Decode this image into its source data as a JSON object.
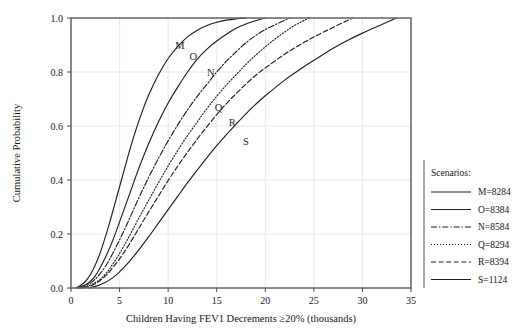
{
  "chart_data": {
    "type": "line",
    "title": "",
    "xlabel": "Children Having FEV1 Decrements ≥20% (thousands)",
    "ylabel": "Cumulative Probability",
    "xlim": [
      0,
      35
    ],
    "ylim": [
      0.0,
      1.0
    ],
    "xticks": [
      "0",
      "5",
      "10",
      "15",
      "20",
      "25",
      "30",
      "35"
    ],
    "xtick_values": [
      0,
      5,
      10,
      15,
      20,
      25,
      30,
      35
    ],
    "yticks": [
      "0.0",
      "0.2",
      "0.4",
      "0.6",
      "0.8",
      "1.0"
    ],
    "ytick_values": [
      0.0,
      0.2,
      0.4,
      0.6,
      0.8,
      1.0
    ],
    "grid": true,
    "legend_position": "right-outside",
    "legend_title": "Scenarios:",
    "series": [
      {
        "name": "M=8284",
        "tag": "M",
        "dash": "none",
        "style_name": "solid-thin",
        "x": [
          0.5,
          1.0,
          1.5,
          2.0,
          2.5,
          3.0,
          3.5,
          4.0,
          4.5,
          5.0,
          5.5,
          6.0,
          6.5,
          7.0,
          7.5,
          8.0,
          9.0,
          10.0,
          11.0,
          12.0,
          13.0,
          14.0,
          15.0,
          16.0,
          17.0,
          18.0
        ],
        "y": [
          0.0,
          0.01,
          0.025,
          0.05,
          0.085,
          0.13,
          0.185,
          0.245,
          0.31,
          0.375,
          0.44,
          0.505,
          0.565,
          0.62,
          0.67,
          0.715,
          0.79,
          0.85,
          0.895,
          0.93,
          0.955,
          0.972,
          0.984,
          0.992,
          0.997,
          1.0
        ]
      },
      {
        "name": "O=8384",
        "tag": "O",
        "dash": "none",
        "style_name": "solid",
        "x": [
          0.7,
          1.5,
          2.0,
          2.5,
          3.0,
          3.5,
          4.0,
          4.5,
          5.0,
          5.5,
          6.0,
          7.0,
          8.0,
          9.0,
          10.0,
          11.0,
          12.0,
          13.0,
          14.0,
          15.0,
          16.0,
          17.0,
          18.0,
          19.0,
          20.0
        ],
        "y": [
          0.0,
          0.012,
          0.025,
          0.045,
          0.075,
          0.11,
          0.15,
          0.195,
          0.245,
          0.295,
          0.345,
          0.445,
          0.535,
          0.615,
          0.685,
          0.745,
          0.8,
          0.848,
          0.885,
          0.915,
          0.94,
          0.962,
          0.978,
          0.99,
          1.0
        ]
      },
      {
        "name": "N=8584",
        "tag": "N",
        "dash": "dash-dot",
        "style_name": "dash-dot",
        "x": [
          0.9,
          1.5,
          2.0,
          2.5,
          3.0,
          3.5,
          4.0,
          5.0,
          6.0,
          7.0,
          8.0,
          9.0,
          10.0,
          11.0,
          12.0,
          13.0,
          14.0,
          15.0,
          16.0,
          17.0,
          18.0,
          19.0,
          20.0,
          21.0,
          22.5
        ],
        "y": [
          0.0,
          0.008,
          0.018,
          0.033,
          0.053,
          0.078,
          0.108,
          0.178,
          0.255,
          0.335,
          0.41,
          0.48,
          0.545,
          0.605,
          0.66,
          0.71,
          0.755,
          0.8,
          0.84,
          0.875,
          0.908,
          0.935,
          0.957,
          0.975,
          1.0
        ]
      },
      {
        "name": "Q=8294",
        "tag": "Q",
        "dash": "dotted",
        "style_name": "fine-dotted",
        "x": [
          1.0,
          1.8,
          2.5,
          3.0,
          3.5,
          4.0,
          5.0,
          6.0,
          7.0,
          8.0,
          9.0,
          10.0,
          11.0,
          12.0,
          13.0,
          14.0,
          15.0,
          16.0,
          17.0,
          18.0,
          19.0,
          20.0,
          21.0,
          22.0,
          23.0,
          24.5
        ],
        "y": [
          0.0,
          0.008,
          0.02,
          0.032,
          0.05,
          0.072,
          0.128,
          0.192,
          0.26,
          0.325,
          0.39,
          0.452,
          0.51,
          0.565,
          0.615,
          0.665,
          0.71,
          0.752,
          0.79,
          0.828,
          0.862,
          0.893,
          0.922,
          0.948,
          0.972,
          1.0
        ]
      },
      {
        "name": "R=8394",
        "tag": "R",
        "dash": "dashed",
        "style_name": "dashed",
        "x": [
          1.3,
          2.0,
          2.5,
          3.0,
          3.5,
          4.0,
          5.0,
          6.0,
          7.0,
          8.0,
          9.0,
          10.0,
          11.0,
          12.0,
          13.0,
          14.0,
          15.0,
          16.0,
          17.0,
          18.0,
          19.0,
          20.0,
          22.0,
          24.0,
          26.0,
          29.0
        ],
        "y": [
          0.0,
          0.008,
          0.016,
          0.028,
          0.043,
          0.062,
          0.108,
          0.162,
          0.222,
          0.282,
          0.34,
          0.398,
          0.452,
          0.503,
          0.552,
          0.598,
          0.642,
          0.683,
          0.72,
          0.755,
          0.787,
          0.815,
          0.866,
          0.91,
          0.948,
          1.0
        ]
      },
      {
        "name": "S=1124",
        "tag": "S",
        "dash": "none",
        "style_name": "solid",
        "x": [
          1.8,
          2.5,
          3.0,
          3.5,
          4.0,
          4.5,
          5.0,
          6.0,
          7.0,
          8.0,
          9.0,
          10.0,
          11.0,
          12.0,
          13.0,
          14.0,
          15.0,
          16.0,
          17.0,
          18.0,
          19.0,
          20.0,
          22.0,
          24.0,
          26.0,
          28.0,
          30.0,
          33.5
        ],
        "y": [
          0.0,
          0.006,
          0.012,
          0.02,
          0.031,
          0.044,
          0.06,
          0.098,
          0.142,
          0.19,
          0.24,
          0.29,
          0.34,
          0.39,
          0.437,
          0.483,
          0.527,
          0.568,
          0.607,
          0.645,
          0.68,
          0.712,
          0.77,
          0.82,
          0.866,
          0.908,
          0.944,
          1.0
        ]
      }
    ],
    "curve_tags": [
      {
        "label": "M",
        "x": 11.2,
        "y": 0.885
      },
      {
        "label": "O",
        "x": 12.6,
        "y": 0.845
      },
      {
        "label": "N",
        "x": 14.4,
        "y": 0.787
      },
      {
        "label": "Q",
        "x": 15.2,
        "y": 0.655
      },
      {
        "label": "R",
        "x": 16.6,
        "y": 0.6
      },
      {
        "label": "S",
        "x": 18.0,
        "y": 0.528
      }
    ]
  },
  "legend": {
    "title": "Scenarios:",
    "entries": [
      {
        "label": "M=8284"
      },
      {
        "label": "O=8384"
      },
      {
        "label": "N=8584"
      },
      {
        "label": "Q=8294"
      },
      {
        "label": "R=8394"
      },
      {
        "label": "S=1124"
      }
    ]
  }
}
